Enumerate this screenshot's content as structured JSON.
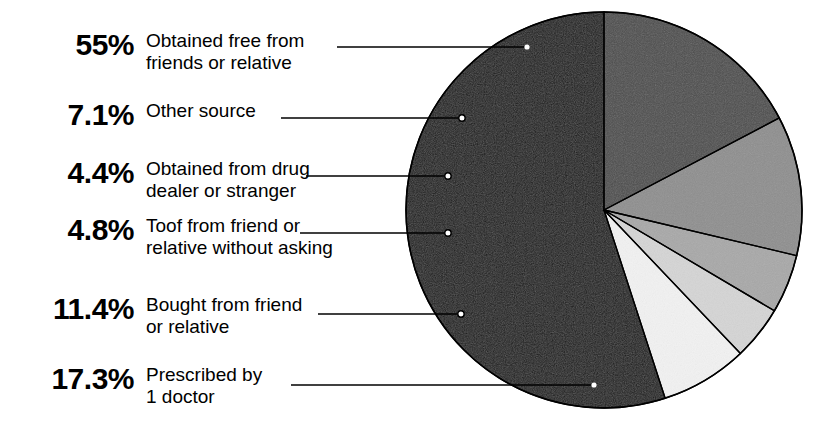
{
  "chart_data": {
    "type": "pie",
    "title": "",
    "subtitle": "",
    "xlabel": "",
    "ylabel": "",
    "legend_position": "left",
    "grid": false,
    "units": "percent",
    "total": 100,
    "start_angle_deg": -90,
    "direction": "counterclockwise",
    "center": {
      "x": 604,
      "y": 210
    },
    "radius": 198,
    "categories": [
      "Obtained free from friends or relative",
      "Other source",
      "Obtained from drug dealer or stranger",
      "Toof from friend or relative without asking",
      "Bought from friend or relative",
      "Prescribed by 1 doctor"
    ],
    "values": [
      55,
      7.1,
      4.4,
      4.8,
      11.4,
      17.3
    ],
    "value_labels": [
      "55%",
      "7.1%",
      "4.4%",
      "4.8%",
      "11.4%",
      "17.3%"
    ],
    "slice_colors": [
      "#1a1a1a",
      "#f2f2f2",
      "#d5d5d5",
      "#a8a8a8",
      "#8e8e8e",
      "#4d4d4d"
    ],
    "slices": [
      {
        "label": "Obtained free from friends or relative",
        "label_line1": "Obtained free from",
        "label_line2": "friends or relative",
        "value": 55,
        "value_label": "55%",
        "color": "#1a1a1a",
        "marker": "white-dot"
      },
      {
        "label": "Other source",
        "label_line1": "Other source",
        "label_line2": "",
        "value": 7.1,
        "value_label": "7.1%",
        "color": "#f2f2f2",
        "marker": "open-circle"
      },
      {
        "label": "Obtained from drug dealer or stranger",
        "label_line1": "Obtained from drug",
        "label_line2": "dealer or stranger",
        "value": 4.4,
        "value_label": "4.4%",
        "color": "#d5d5d5",
        "marker": "open-circle"
      },
      {
        "label": "Toof from friend or relative without asking",
        "label_line1": "Toof from friend or",
        "label_line2": "relative without asking",
        "value": 4.8,
        "value_label": "4.8%",
        "color": "#a8a8a8",
        "marker": "open-circle"
      },
      {
        "label": "Bought from friend or relative",
        "label_line1": "Bought from friend",
        "label_line2": "or relative",
        "value": 11.4,
        "value_label": "11.4%",
        "color": "#8e8e8e",
        "marker": "open-circle"
      },
      {
        "label": "Prescribed by 1 doctor",
        "label_line1": "Prescribed by",
        "label_line2": "1 doctor",
        "value": 17.3,
        "value_label": "17.3%",
        "color": "#4d4d4d",
        "marker": "white-dot"
      }
    ]
  },
  "legend": [
    {
      "pct": "55%",
      "label": "Obtained free from\nfriends or relative"
    },
    {
      "pct": "7.1%",
      "label": "Other source"
    },
    {
      "pct": "4.4%",
      "label": "Obtained from drug\ndealer or stranger"
    },
    {
      "pct": "4.8%",
      "label": "Toof from friend or\nrelative without asking"
    },
    {
      "pct": "11.4%",
      "label": "Bought from friend\nor relative"
    },
    {
      "pct": "17.3%",
      "label": "Prescribed by\n1 doctor"
    }
  ],
  "colors": {
    "background": "#ffffff",
    "text": "#000000",
    "outline": "#000000",
    "leader_line": "#000000"
  }
}
